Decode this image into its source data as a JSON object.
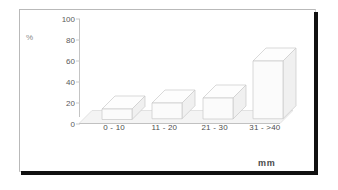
{
  "figure": {
    "kind": "scanned-bar-chart",
    "frame": {
      "border_color": "#b9b9b9",
      "shadow_color": "#111111"
    },
    "background": "#ffffff"
  },
  "labels": {
    "y_axis_title": "%",
    "x_axis_title": "mm"
  },
  "chart_data": {
    "type": "bar",
    "title": "",
    "subtitle": "",
    "xlabel": "mm",
    "ylabel": "%",
    "categories": [
      "0 - 10",
      "11 - 20",
      "21 - 30",
      "31 - >40"
    ],
    "values": [
      10,
      15,
      20,
      55
    ],
    "series": [
      {
        "name": "percent",
        "values": [
          10,
          15,
          20,
          55
        ]
      }
    ],
    "ylim": [
      0,
      100
    ],
    "yticks": [
      0,
      20,
      40,
      60,
      80,
      100
    ],
    "ytick_labels": [
      "0",
      "20",
      "40",
      "60",
      "80",
      "100"
    ],
    "grid": false,
    "legend": null,
    "legend_position": "none",
    "style": "3d-isometric-bars",
    "bar_fill": "#fbfbfb",
    "bar_edge": "#c8c8c8",
    "annotations": []
  }
}
